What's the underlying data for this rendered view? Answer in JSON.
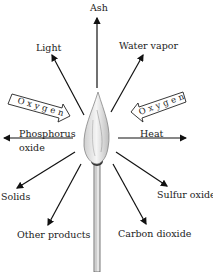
{
  "diagram": {
    "labels": {
      "ash": "Ash",
      "light": "Light",
      "water_vapor": "Water vapor",
      "phosphorus_oxide_line1": "Phosphorus",
      "phosphorus_oxide_line2": "oxide",
      "heat": "Heat",
      "solids": "Solids",
      "sulfur_oxide": "Sulfur oxide",
      "other_products": "Other products",
      "carbon_dioxide": "Carbon dioxide"
    },
    "oxygen_left": "Oxygen",
    "oxygen_right": "Oxygen"
  }
}
